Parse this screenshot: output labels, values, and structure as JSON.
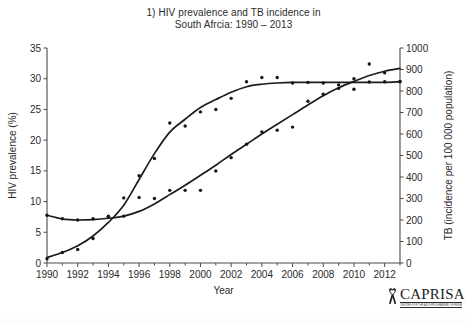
{
  "figure": {
    "title_lines": [
      "1) HIV prevalence and TB incidence in",
      "South Afrcia: 1990 – 2013"
    ],
    "logo": {
      "wordmark": "CAPRISA",
      "tagline": "CENTRE FOR THE AIDS PROGRAMME OF RESEARCH IN SOUTH AFRICA",
      "ribbon_icon": "aids-ribbon-icon",
      "ribbon_color": "#1d1d1d"
    }
  },
  "chart_data": {
    "type": "scatter",
    "title": "1) HIV prevalence and TB incidence in South Afrcia: 1990 – 2013",
    "xlabel": "Year",
    "ylabel": "HIV prevalence (%)",
    "y2label": "TB (incidence per 100 000 population)",
    "xlim": [
      1990,
      2013
    ],
    "ylim": [
      0,
      35
    ],
    "y2lim": [
      0,
      1000
    ],
    "grid": false,
    "legend": "none",
    "xticks": [
      1990,
      1992,
      1994,
      1996,
      1998,
      2000,
      2002,
      2004,
      2006,
      2008,
      2010,
      2012
    ],
    "xtick_labels": [
      "1990",
      "1992",
      "1994",
      "1996",
      "1998",
      "2000",
      "2002",
      "2004",
      "2006",
      "2008",
      "2010",
      "2012"
    ],
    "xminorticks": [
      1991,
      1993,
      1995,
      1997,
      1999,
      2001,
      2003,
      2005,
      2007,
      2009,
      2011,
      2013
    ],
    "yticks": [
      0,
      5,
      10,
      15,
      20,
      25,
      30,
      35
    ],
    "ytick_labels": [
      "0",
      "5",
      "10",
      "15",
      "20",
      "25",
      "30",
      "35"
    ],
    "y2ticks": [
      0,
      100,
      200,
      300,
      400,
      500,
      600,
      700,
      800,
      900,
      1000
    ],
    "y2tick_labels": [
      "0",
      "100",
      "200",
      "300",
      "400",
      "500",
      "600",
      "700",
      "800",
      "900",
      "1000"
    ],
    "x": [
      1990,
      1991,
      1992,
      1993,
      1994,
      1995,
      1996,
      1997,
      1998,
      1999,
      2000,
      2001,
      2002,
      2003,
      2004,
      2005,
      2006,
      2007,
      2008,
      2009,
      2010,
      2011,
      2012,
      2013
    ],
    "series": [
      {
        "name": "HIV prevalence (%)",
        "axis": "left",
        "marker": "dot",
        "units": "%",
        "values": [
          0.7,
          1.7,
          2.2,
          4.0,
          7.6,
          10.6,
          14.2,
          17.0,
          22.8,
          22.3,
          24.6,
          25.0,
          26.8,
          29.5,
          30.2,
          30.2,
          29.3,
          29.4,
          29.3,
          29.0,
          30.0,
          32.4,
          29.5,
          29.5
        ],
        "trend_values": [
          0.9,
          1.7,
          2.8,
          4.4,
          6.6,
          9.4,
          13.6,
          17.8,
          21.3,
          23.4,
          25.3,
          26.6,
          27.8,
          28.7,
          29.1,
          29.3,
          29.4,
          29.4,
          29.4,
          29.4,
          29.4,
          29.4,
          29.4,
          29.5
        ]
      },
      {
        "name": "TB incidence (per 100 000 population)",
        "axis": "right",
        "marker": "dot",
        "units": "per 100 000",
        "values": [
          222,
          206,
          200,
          206,
          215,
          218,
          305,
          300,
          338,
          338,
          338,
          428,
          490,
          552,
          610,
          618,
          632,
          752,
          785,
          812,
          808,
          842,
          885,
          845
        ],
        "trend_values": [
          222,
          205,
          200,
          202,
          208,
          218,
          240,
          275,
          318,
          362,
          408,
          455,
          505,
          552,
          600,
          645,
          690,
          735,
          778,
          815,
          845,
          872,
          892,
          905
        ]
      }
    ],
    "annotations": [
      "The HIV prevalence curve rises steeply from 1994 and plateaus near 29–30% after 2003.",
      "The TB incidence curve rises steadily from about 220 per 100 000 in 1990 to about 900 per 100 000 in 2013.",
      "The two fitted curves intersect near 1995 and again near 2009–2010."
    ]
  }
}
